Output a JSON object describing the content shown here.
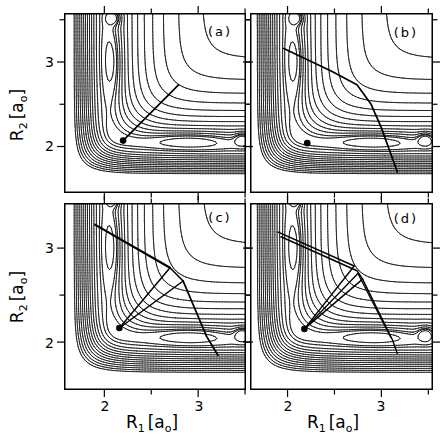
{
  "chart_data": {
    "type": "contour",
    "xlabel": "R1 [a0]",
    "ylabel": "R2 [a0]",
    "xlabel_parts": {
      "base": "R",
      "base_sub": "1",
      "unit_open": "[a",
      "unit_sub": "o",
      "unit_close": "]"
    },
    "ylabel_parts": {
      "base": "R",
      "base_sub": "2",
      "unit_open": "[a",
      "unit_sub": "o",
      "unit_close": "]"
    },
    "x_ticks": {
      "major": [
        2,
        3
      ],
      "labels": [
        "2",
        "3"
      ],
      "minor": [
        2.5,
        3.5
      ]
    },
    "y_ticks": {
      "major": [
        2,
        3
      ],
      "labels": [
        "2",
        "3"
      ],
      "minor": [
        2.5,
        3.5
      ]
    },
    "panel_x_ranges": {
      "left": [
        1.57,
        3.51
      ],
      "right": [
        1.6,
        3.55
      ]
    },
    "panel_y_ranges": {
      "top": [
        1.45,
        3.58
      ],
      "bottom": [
        1.49,
        3.48
      ]
    },
    "surface": {
      "grid_min": 1.42,
      "grid_max": 3.58,
      "grid_n": 130,
      "model": {
        "D": 4.746,
        "r0": 2.0,
        "beta": 2.1,
        "sato": 0.1425,
        "wells": [
          {
            "cx": 2.9,
            "cy": 2.08,
            "d": 0.35,
            "wx": 0.22,
            "wy": 0.012
          },
          {
            "cx": 3.47,
            "cy": 2.09,
            "d": 0.4,
            "wx": 0.006,
            "wy": 0.006
          },
          {
            "cx": 2.1,
            "cy": 3.0,
            "d": 0.35,
            "wx": 0.012,
            "wy": 0.22
          },
          {
            "cx": 2.1,
            "cy": 3.52,
            "d": 0.4,
            "wx": 0.006,
            "wy": 0.006
          }
        ]
      },
      "levels": [
        -4.9,
        -4.78,
        -4.7,
        -4.56,
        -4.4,
        -4.21,
        -3.99,
        -3.73,
        -3.43,
        -3.08,
        -2.67,
        -2.19,
        -1.63,
        -1.0,
        -0.3
      ]
    },
    "panels": [
      {
        "label": "(a)",
        "dot": [
          2.2,
          2.07
        ],
        "trajectories": [
          {
            "width": 1.7,
            "points": [
              [
                2.2,
                2.07
              ],
              [
                2.79,
                2.73
              ]
            ]
          }
        ]
      },
      {
        "label": "(b)",
        "dot": [
          2.21,
          2.04
        ],
        "trajectories": [
          {
            "width": 1.7,
            "points": [
              [
                1.96,
                3.16
              ],
              [
                2.47,
                2.89
              ],
              [
                2.74,
                2.73
              ],
              [
                2.89,
                2.5
              ],
              [
                3.0,
                2.22
              ],
              [
                3.17,
                1.7
              ]
            ]
          }
        ]
      },
      {
        "label": "(c)",
        "dot": [
          2.16,
          2.15
        ],
        "trajectories": [
          {
            "width": 2.2,
            "points": [
              [
                1.9,
                3.25
              ],
              [
                2.7,
                2.79
              ]
            ]
          },
          {
            "width": 1.6,
            "points": [
              [
                2.7,
                2.79
              ],
              [
                2.84,
                2.65
              ]
            ]
          },
          {
            "width": 1.5,
            "points": [
              [
                2.7,
                2.79
              ],
              [
                2.16,
                2.15
              ]
            ]
          },
          {
            "width": 1.5,
            "points": [
              [
                2.84,
                2.65
              ],
              [
                2.16,
                2.15
              ]
            ]
          },
          {
            "width": 1.8,
            "points": [
              [
                2.84,
                2.65
              ],
              [
                3.09,
                2.06
              ],
              [
                3.21,
                1.86
              ]
            ]
          }
        ]
      },
      {
        "label": "(d)",
        "dot": [
          2.18,
          2.14
        ],
        "trajectories": [
          {
            "width": 1.5,
            "points": [
              [
                1.9,
                3.17
              ],
              [
                2.71,
                2.81
              ]
            ]
          },
          {
            "width": 1.5,
            "points": [
              [
                1.93,
                3.12
              ],
              [
                2.74,
                2.76
              ],
              [
                2.8,
                2.67
              ]
            ]
          },
          {
            "width": 1.4,
            "points": [
              [
                2.71,
                2.81
              ],
              [
                2.18,
                2.14
              ]
            ]
          },
          {
            "width": 1.4,
            "points": [
              [
                2.8,
                2.67
              ],
              [
                2.18,
                2.14
              ]
            ]
          },
          {
            "width": 1.3,
            "points": [
              [
                2.75,
                2.73
              ],
              [
                2.19,
                2.15
              ]
            ]
          },
          {
            "width": 1.4,
            "points": [
              [
                2.8,
                2.67
              ],
              [
                3.12,
                2.02
              ],
              [
                3.17,
                1.88
              ]
            ]
          },
          {
            "width": 1.3,
            "points": [
              [
                2.75,
                2.73
              ],
              [
                3.1,
                2.05
              ]
            ]
          }
        ]
      }
    ],
    "line_color": "#000000",
    "background_color": "#ffffff"
  }
}
